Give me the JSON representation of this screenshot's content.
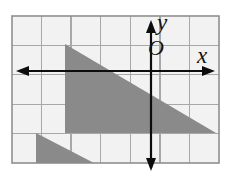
{
  "figure": {
    "kind": "coordinate-plane-with-shaded-triangles",
    "canvas": {
      "width": 230,
      "height": 185
    },
    "background_color": "#ffffff",
    "labels": {
      "y_axis_label": "y",
      "x_axis_label": "x",
      "origin_label": "O"
    },
    "grid": {
      "visible": true,
      "line_color": "#a8a8a8",
      "border_color": "#8f8f8f",
      "cell_fill": "#f2f2f2",
      "cell_size_px": 29.5,
      "columns": 7,
      "rows": 5,
      "left_px": 12,
      "top_px": 16,
      "right_px": 219,
      "bottom_px": 163
    },
    "axes": {
      "color": "#0d0d0d",
      "stroke_width": 2.2,
      "arrow_heads": [
        "left",
        "right",
        "up",
        "down"
      ],
      "origin_px": {
        "x": 151,
        "y": 71
      },
      "x_axis": {
        "y_px": 71,
        "x_start_px": 16,
        "x_end_px": 215
      },
      "y_axis": {
        "x_px": 151,
        "y_start_px": 20,
        "y_end_px": 171
      }
    },
    "shapes": [
      {
        "name": "large-triangle",
        "type": "triangle",
        "fill": "#8a8a8a",
        "vertices_px": [
          [
            65,
            44
          ],
          [
            65,
            133
          ],
          [
            216,
            133
          ]
        ],
        "vertices_grid": [
          [
            -3,
            1
          ],
          [
            -3,
            -2
          ],
          [
            2,
            -2
          ]
        ]
      },
      {
        "name": "small-triangle",
        "type": "triangle",
        "fill": "#8a8a8a",
        "vertices_px": [
          [
            36,
            133
          ],
          [
            36,
            163
          ],
          [
            94,
            163
          ]
        ],
        "vertices_grid": [
          [
            -4,
            -2
          ],
          [
            -4,
            -3
          ],
          [
            -2,
            -3
          ]
        ]
      }
    ]
  },
  "chart_data": {
    "type": "scatter",
    "title": "",
    "xlabel": "x",
    "ylabel": "y",
    "xlim": [
      -5,
      2
    ],
    "ylim": [
      -3,
      2
    ],
    "grid": true,
    "legend": "none",
    "annotations": [
      "y",
      "O",
      "x"
    ],
    "series": [
      {
        "name": "large-triangle",
        "x": [
          -3,
          -3,
          2,
          -3
        ],
        "y": [
          1,
          -2,
          -2,
          1
        ]
      },
      {
        "name": "small-triangle",
        "x": [
          -4,
          -4,
          -2,
          -4
        ],
        "y": [
          -2,
          -3,
          -3,
          -2
        ]
      }
    ]
  }
}
